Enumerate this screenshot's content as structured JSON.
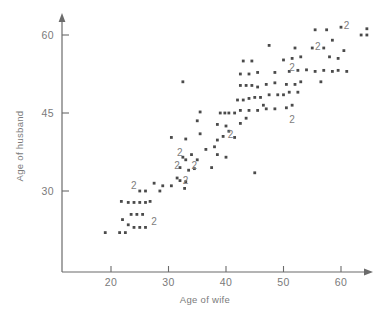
{
  "chart_data": {
    "type": "scatter",
    "title": "",
    "xlabel": "Age of wife",
    "ylabel": "Age of husband",
    "xlim": [
      11.5,
      65.5
    ],
    "ylim": [
      18.5,
      64.0
    ],
    "xticks": [
      20,
      30,
      40,
      50,
      60
    ],
    "xtick_labels": [
      "20",
      "30",
      "40",
      "50",
      "60"
    ],
    "yticks": [
      30,
      45,
      60
    ],
    "ytick_labels": [
      "30",
      "45",
      "60"
    ],
    "grid": false,
    "legend": null,
    "point_marker": "square-dot",
    "overplot_notation": "Digit '2' marks a location where two observations coincide.",
    "points": [
      [
        19.0,
        22.0
      ],
      [
        21.5,
        22.0
      ],
      [
        22.5,
        22.0
      ],
      [
        22.0,
        24.5
      ],
      [
        23.0,
        23.5
      ],
      [
        23.5,
        25.5
      ],
      [
        24.5,
        25.5
      ],
      [
        25.5,
        25.5
      ],
      [
        23.0,
        27.8
      ],
      [
        24.0,
        27.8
      ],
      [
        25.0,
        27.8
      ],
      [
        26.0,
        27.8
      ],
      [
        21.8,
        28.0
      ],
      [
        26.8,
        28.0
      ],
      [
        25.0,
        30.0
      ],
      [
        26.0,
        30.0
      ],
      [
        28.5,
        30.0
      ],
      [
        27.5,
        31.5
      ],
      [
        29.0,
        31.0
      ],
      [
        30.5,
        31.0
      ],
      [
        32.8,
        30.5
      ],
      [
        32.0,
        32.0
      ],
      [
        33.0,
        31.8
      ],
      [
        31.5,
        32.5
      ],
      [
        32.0,
        34.5
      ],
      [
        33.5,
        34.0
      ],
      [
        34.5,
        34.3
      ],
      [
        37.5,
        34.5
      ],
      [
        32.5,
        36.5
      ],
      [
        33.0,
        36.0
      ],
      [
        34.0,
        37.0
      ],
      [
        35.0,
        36.0
      ],
      [
        36.5,
        38.0
      ],
      [
        38.0,
        38.5
      ],
      [
        38.5,
        37.0
      ],
      [
        40.0,
        36.5
      ],
      [
        30.5,
        40.3
      ],
      [
        33.0,
        40.0
      ],
      [
        35.5,
        41.0
      ],
      [
        38.5,
        39.8
      ],
      [
        39.5,
        40.5
      ],
      [
        40.5,
        41.5
      ],
      [
        41.5,
        40.3
      ],
      [
        35.0,
        43.5
      ],
      [
        38.5,
        42.8
      ],
      [
        40.0,
        42.5
      ],
      [
        42.5,
        43.0
      ],
      [
        43.5,
        44.0
      ],
      [
        35.5,
        45.2
      ],
      [
        39.0,
        45.0
      ],
      [
        39.8,
        45.0
      ],
      [
        40.5,
        45.0
      ],
      [
        41.5,
        45.0
      ],
      [
        42.5,
        45.5
      ],
      [
        44.0,
        45.5
      ],
      [
        45.5,
        45.5
      ],
      [
        46.5,
        46.5
      ],
      [
        47.0,
        45.8
      ],
      [
        48.5,
        45.8
      ],
      [
        50.5,
        46.0
      ],
      [
        51.5,
        46.5
      ],
      [
        42.0,
        47.5
      ],
      [
        43.0,
        47.5
      ],
      [
        44.0,
        47.8
      ],
      [
        45.0,
        48.0
      ],
      [
        46.0,
        48.0
      ],
      [
        47.5,
        48.5
      ],
      [
        49.0,
        48.5
      ],
      [
        50.0,
        48.5
      ],
      [
        51.0,
        49.0
      ],
      [
        52.5,
        49.0
      ],
      [
        42.5,
        50.3
      ],
      [
        43.5,
        50.3
      ],
      [
        44.5,
        50.3
      ],
      [
        45.5,
        50.0
      ],
      [
        47.0,
        50.5
      ],
      [
        48.5,
        50.8
      ],
      [
        50.5,
        50.5
      ],
      [
        52.0,
        50.5
      ],
      [
        53.0,
        51.0
      ],
      [
        56.5,
        51.0
      ],
      [
        32.5,
        51.0
      ],
      [
        42.5,
        52.5
      ],
      [
        44.0,
        52.5
      ],
      [
        45.5,
        52.8
      ],
      [
        48.5,
        52.8
      ],
      [
        51.0,
        53.0
      ],
      [
        52.5,
        53.2
      ],
      [
        54.0,
        53.3
      ],
      [
        55.5,
        53.0
      ],
      [
        57.0,
        53.2
      ],
      [
        58.5,
        53.0
      ],
      [
        59.5,
        53.2
      ],
      [
        61.0,
        53.0
      ],
      [
        43.0,
        55.0
      ],
      [
        44.5,
        55.0
      ],
      [
        50.0,
        55.2
      ],
      [
        51.5,
        55.5
      ],
      [
        53.0,
        55.8
      ],
      [
        58.0,
        55.8
      ],
      [
        59.5,
        55.5
      ],
      [
        47.5,
        58.0
      ],
      [
        52.0,
        57.5
      ],
      [
        55.0,
        57.5
      ],
      [
        57.0,
        57.5
      ],
      [
        60.5,
        57.0
      ],
      [
        58.5,
        59.0
      ],
      [
        55.5,
        61.0
      ],
      [
        57.5,
        61.0
      ],
      [
        60.0,
        61.5
      ],
      [
        64.5,
        61.2
      ],
      [
        63.5,
        60.0
      ],
      [
        64.5,
        60.0
      ],
      [
        45.0,
        33.5
      ],
      [
        24.0,
        23.0
      ],
      [
        25.0,
        23.0
      ],
      [
        26.0,
        23.0
      ]
    ],
    "overplot_points": [
      {
        "x": 24.0,
        "y": 31.2,
        "label": "2"
      },
      {
        "x": 27.5,
        "y": 24.3,
        "label": "2"
      },
      {
        "x": 32.0,
        "y": 37.5,
        "label": "2"
      },
      {
        "x": 31.5,
        "y": 35.0,
        "label": "2"
      },
      {
        "x": 34.5,
        "y": 35.0,
        "label": "2"
      },
      {
        "x": 33.0,
        "y": 32.2,
        "label": "2"
      },
      {
        "x": 40.8,
        "y": 41.0,
        "label": "2"
      },
      {
        "x": 51.5,
        "y": 43.8,
        "label": "2"
      },
      {
        "x": 51.5,
        "y": 53.8,
        "label": "2"
      },
      {
        "x": 56.0,
        "y": 57.8,
        "label": "2"
      },
      {
        "x": 61.0,
        "y": 62.0,
        "label": "2"
      }
    ]
  },
  "figure": {
    "axis_color": "#6b6b6b",
    "point_color": "#4a4a4a",
    "label_color": "#7a7a7a",
    "background": "#ffffff"
  }
}
